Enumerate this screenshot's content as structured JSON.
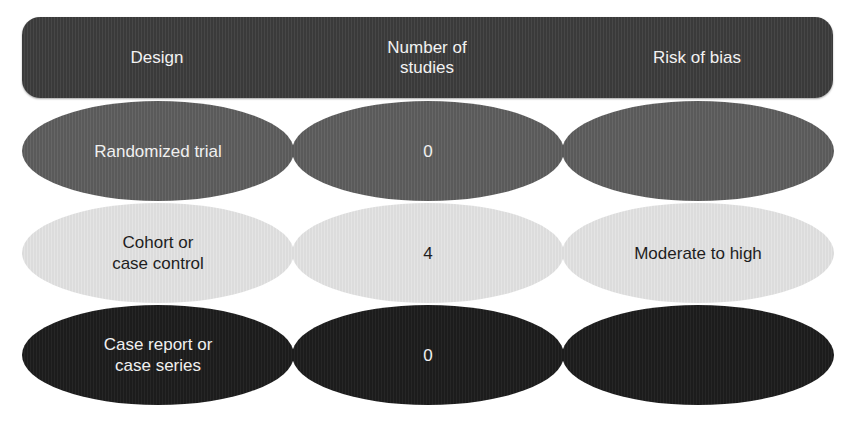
{
  "header": {
    "columns": [
      "Design",
      "Number of\nstudies",
      "Risk of bias"
    ],
    "col1_line1": "Number of",
    "col1_line2": "studies"
  },
  "rows": [
    {
      "design": "Randomized trial",
      "design_line1": "Randomized trial",
      "design_line2": "",
      "studies": "0",
      "risk": "",
      "fill": "#606060",
      "text_color": "#f0f0f0"
    },
    {
      "design": "Cohort or case control",
      "design_line1": "Cohort or",
      "design_line2": "case control",
      "studies": "4",
      "risk": "Moderate to high",
      "fill": "#e0e0e0",
      "text_color": "#1e1e1e"
    },
    {
      "design": "Case report or case series",
      "design_line1": "Case report or",
      "design_line2": "case series",
      "studies": "0",
      "risk": "",
      "fill": "#212121",
      "text_color": "#f0f0f0"
    }
  ],
  "colors": {
    "header_fill": "#404040",
    "header_text": "#f2f2f2",
    "background": "#ffffff"
  }
}
